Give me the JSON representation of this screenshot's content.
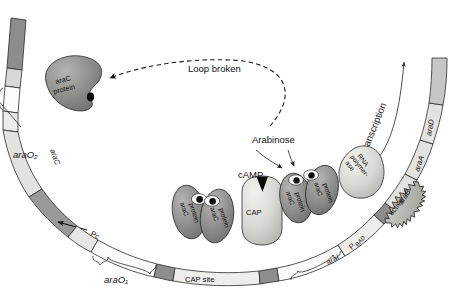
{
  "figure": {
    "background": "#ffffff"
  },
  "annotations": {
    "loop_broken": "Loop broken",
    "arabinose": "Arabinose",
    "transcription": "Transcription",
    "camp": "cAMP",
    "active": "active"
  },
  "dna_sites": {
    "araO2": "araO₂",
    "araO1": "araO₁",
    "araI": "araI",
    "cap_site": "CAP site",
    "pc": "Pc",
    "pbad_p": "P",
    "pbad_sub": "BAD"
  },
  "genes": {
    "araC": "araC",
    "araB": "araB",
    "araA": "araA",
    "araD": "araD"
  },
  "proteins": {
    "arac_line1": "araC",
    "arac_line2": "protein",
    "cap": "CAP",
    "rnap_line1": "RNA",
    "rnap_line2": "polymer-",
    "rnap_line3": "ase"
  },
  "protein_instances": [
    {
      "name": "araC-protein-free",
      "label_top": "araC",
      "label_bottom": "protein",
      "role": "unbound-araC-at-araO2"
    },
    {
      "name": "araC-protein-dimer-left-a",
      "label_top": "araC",
      "label_bottom": "protein",
      "role": "araO1-dimer-left"
    },
    {
      "name": "araC-protein-dimer-left-b",
      "label_top": "araC",
      "label_bottom": "protein",
      "role": "araO1-dimer-right"
    },
    {
      "name": "araC-protein-dimer-right-a",
      "label_top": "araC",
      "label_bottom": "protein",
      "role": "araI-dimer-left"
    },
    {
      "name": "araC-protein-dimer-right-b",
      "label_top": "araC",
      "label_bottom": "protein",
      "role": "araI-dimer-right"
    }
  ],
  "colors": {
    "dna_dark": "#8d8d8d",
    "dna_mid": "#b9b9b9",
    "dna_light": "#d8d8d8",
    "dna_pale": "#ececeb",
    "dna_white": "#fbfbfb",
    "protein_dark": "#8a8a8a",
    "protein_light": "#d6d6d4",
    "outline": "#2b2b2b",
    "text": "#111111"
  }
}
